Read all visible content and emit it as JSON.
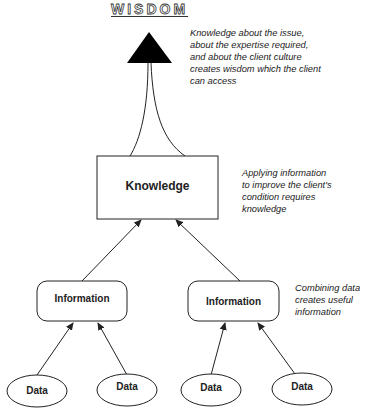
{
  "title": "WISDOM",
  "notes": {
    "wisdom": [
      "Knowledge about the issue,",
      "about the expertise required,",
      "and about the client culture",
      "creates wisdom which the client",
      "can access"
    ],
    "knowledge": [
      "Applying information",
      "to improve the client's",
      "condition requires",
      "knowledge"
    ],
    "information": [
      "Combining data",
      "creates useful",
      "information"
    ]
  },
  "nodes": {
    "knowledge": "Knowledge",
    "information_left": "Information",
    "information_right": "Information",
    "data": [
      "Data",
      "Data",
      "Data",
      "Data"
    ]
  },
  "colors": {
    "line": "#222222",
    "triangle": "#000000",
    "background": "#ffffff"
  }
}
